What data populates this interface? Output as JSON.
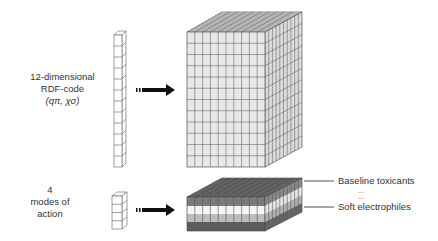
{
  "diagram": {
    "top": {
      "label_line1": "12-dimensional",
      "label_line2": "RDF-code",
      "label_line3": "(qπ, χσ)",
      "input_column_cells": 12,
      "cube": {
        "front_cols": 10,
        "front_rows": 12,
        "depth_cells": 10,
        "fill": "#e6e6e6"
      }
    },
    "bottom": {
      "label_line1": "4",
      "label_line2": "modes of",
      "label_line3": "action",
      "input_column_cells": 4,
      "slab": {
        "layers": [
          {
            "name": "Baseline toxicants",
            "color": "#7a7a7a"
          },
          {
            "name": "",
            "color": "#f4f4f4"
          },
          {
            "name": "",
            "color": "#bdbdbd"
          },
          {
            "name": "Soft electrophiles",
            "color": "#5c5c5c"
          }
        ]
      },
      "legend": {
        "top_label": "Baseline toxicants",
        "ellipsis1": "...",
        "ellipsis2": "...",
        "bottom_label": "Soft electrophiles"
      }
    },
    "arrow_icon": "right-arrow"
  }
}
